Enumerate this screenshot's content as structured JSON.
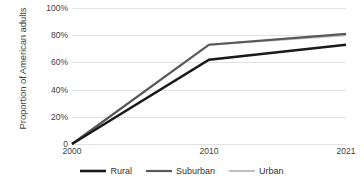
{
  "chart_data": {
    "type": "line",
    "title": "",
    "subtitle": "",
    "xlabel": "",
    "ylabel": "Proportion of American adults",
    "x": [
      "2000",
      "2010",
      "2021"
    ],
    "categories": [
      "2000",
      "2010",
      "2021"
    ],
    "xtick_labels": [
      "2000",
      "2010",
      "2021"
    ],
    "ytick_labels": [
      "0",
      "20%",
      "40%",
      "60%",
      "80%",
      "100%"
    ],
    "ytick_values": [
      0,
      20,
      40,
      60,
      80,
      100
    ],
    "ylim": [
      0,
      100
    ],
    "grid": "horizontal",
    "legend_position": "bottom-center",
    "series": [
      {
        "name": "Rural",
        "values": [
          0,
          62,
          73
        ],
        "color": "#1a1a1a",
        "width": 2.6
      },
      {
        "name": "Suburban",
        "values": [
          0,
          73,
          81
        ],
        "color": "#595959",
        "width": 2.2
      },
      {
        "name": "Urban",
        "values": [
          0,
          73,
          80
        ],
        "color": "#bfbfbf",
        "width": 2.0
      }
    ]
  },
  "axes": {
    "y_title": "Proportion of American adults",
    "y_ticks": [
      {
        "label": "100%",
        "value": 100
      },
      {
        "label": "80%",
        "value": 80
      },
      {
        "label": "60%",
        "value": 60
      },
      {
        "label": "40%",
        "value": 40
      },
      {
        "label": "20%",
        "value": 20
      },
      {
        "label": "0",
        "value": 0
      }
    ],
    "x_ticks": [
      {
        "label": "2000",
        "value": 0
      },
      {
        "label": "2010",
        "value": 1
      },
      {
        "label": "2021",
        "value": 2
      }
    ]
  },
  "legend": {
    "items": [
      {
        "label": "Rural",
        "color": "#1a1a1a"
      },
      {
        "label": "Suburban",
        "color": "#595959"
      },
      {
        "label": "Urban",
        "color": "#bfbfbf"
      }
    ]
  },
  "colors": {
    "background": "#ffffff",
    "gridline": "#e2e2e2",
    "text": "#404040",
    "rural": "#1a1a1a",
    "suburban": "#595959",
    "urban": "#bfbfbf"
  }
}
